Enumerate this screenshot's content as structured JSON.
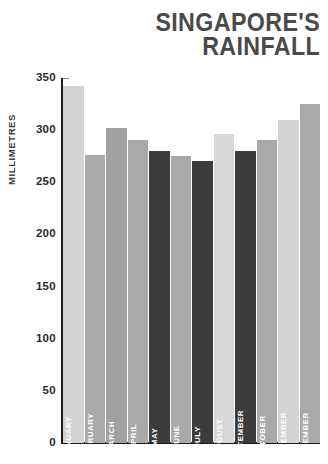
{
  "title": {
    "line1": "SINGAPORE'S",
    "line2": "RAINFALL",
    "color": "#4a4a4a"
  },
  "axes": {
    "y_title": "MILLIMETRES",
    "y_ticks": [
      "350",
      "300",
      "250",
      "200",
      "150",
      "100",
      "50",
      "0"
    ],
    "axis_color": "#1a1a1a"
  },
  "palette": {
    "light": "#d4d4d4",
    "mid": "#a9a9a9",
    "dark": "#3c3c3c",
    "background": "#ffffff",
    "label_text": "#ffffff"
  },
  "chart_data": {
    "type": "bar",
    "title": "SINGAPORE'S RAINFALL",
    "xlabel": "",
    "ylabel": "MILLIMETRES",
    "ylim": [
      0,
      350
    ],
    "yticks": [
      0,
      50,
      100,
      150,
      200,
      250,
      300,
      350
    ],
    "grid": false,
    "legend": "none",
    "categories": [
      "JANUARY",
      "FEBRUARY",
      "MARCH",
      "APRIL",
      "MAY",
      "JUNE",
      "JULY",
      "AUGUST",
      "SEPTEMBER",
      "OCTOBER",
      "NOVEMBER",
      "DECEMBER"
    ],
    "values": [
      342,
      276,
      302,
      291,
      280,
      275,
      270,
      296,
      280,
      291,
      310,
      325
    ],
    "bar_colors": [
      "#d4d4d4",
      "#a9a9a9",
      "#a0a0a0",
      "#a9a9a9",
      "#3c3c3c",
      "#a9a9a9",
      "#3c3c3c",
      "#d8d8d8",
      "#3c3c3c",
      "#a9a9a9",
      "#d4d4d4",
      "#a9a9a9"
    ]
  }
}
